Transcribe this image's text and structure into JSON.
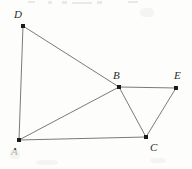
{
  "figure": {
    "kind": "planar-graph-diagram",
    "width": 192,
    "height": 169,
    "background_color": "#fdfdfc",
    "line_color": "#7a7a7a",
    "line_width": 1,
    "vertex_color": "#1a1a1a",
    "label_color": "#2b2b2b",
    "vertices": [
      {
        "id": "D",
        "label": "D",
        "x": 23,
        "y": 26,
        "label_x": 14,
        "label_y": 9,
        "dot_size": 4
      },
      {
        "id": "A",
        "label": "A",
        "x": 19,
        "y": 140,
        "label_x": 11,
        "label_y": 146,
        "dot_size": 4
      },
      {
        "id": "B",
        "label": "B",
        "x": 119,
        "y": 87,
        "label_x": 113,
        "label_y": 70,
        "dot_size": 4
      },
      {
        "id": "C",
        "label": "C",
        "x": 146,
        "y": 137,
        "label_x": 150,
        "label_y": 142,
        "dot_size": 4
      },
      {
        "id": "E",
        "label": "E",
        "x": 176,
        "y": 88,
        "label_x": 174,
        "label_y": 70,
        "dot_size": 4
      }
    ],
    "edges": [
      {
        "from": "D",
        "to": "A",
        "name": "edge-D-A"
      },
      {
        "from": "D",
        "to": "B",
        "name": "edge-D-B"
      },
      {
        "from": "A",
        "to": "B",
        "name": "edge-A-B"
      },
      {
        "from": "A",
        "to": "C",
        "name": "edge-A-C"
      },
      {
        "from": "B",
        "to": "C",
        "name": "edge-B-C"
      },
      {
        "from": "B",
        "to": "E",
        "name": "edge-B-E"
      },
      {
        "from": "C",
        "to": "E",
        "name": "edge-C-E"
      }
    ],
    "artifacts": [
      {
        "x": 28,
        "y": 1,
        "w": 7,
        "h": 2
      },
      {
        "x": 48,
        "y": 1,
        "w": 4,
        "h": 3
      },
      {
        "x": 62,
        "y": 1,
        "w": 5,
        "h": 3
      },
      {
        "x": 72,
        "y": 2,
        "w": 20,
        "h": 2
      },
      {
        "x": 97,
        "y": 1,
        "w": 5,
        "h": 3
      },
      {
        "x": 128,
        "y": 1,
        "w": 10,
        "h": 2
      }
    ],
    "smudges": [
      {
        "x": 10,
        "y": 150,
        "w": 10,
        "h": 9
      },
      {
        "x": 36,
        "y": 160,
        "w": 22,
        "h": 5
      },
      {
        "x": 150,
        "y": 158,
        "w": 16,
        "h": 5
      },
      {
        "x": 140,
        "y": 8,
        "w": 14,
        "h": 9
      }
    ]
  }
}
